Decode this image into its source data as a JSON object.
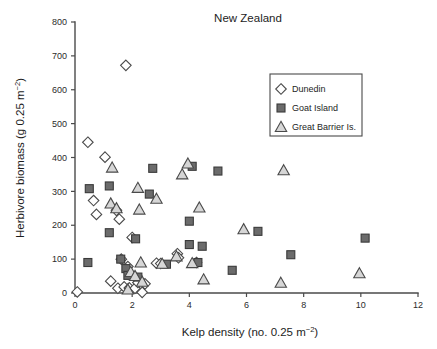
{
  "figure": {
    "title": "New Zealand",
    "background_color": "#ffffff"
  },
  "axes": {
    "x": {
      "label_main": "Kelp density (no. 0.25 m",
      "label_sup": "−2",
      "label_tail": ")",
      "ticks": [
        "0",
        "2",
        "4",
        "6",
        "8",
        "10",
        "12"
      ],
      "min": 0,
      "max": 12
    },
    "y": {
      "label_main": "Herbivore biomass (g 0.25 m",
      "label_sup": "−2",
      "label_tail": ")",
      "ticks": [
        "0",
        "100",
        "200",
        "300",
        "400",
        "500",
        "600",
        "700",
        "800"
      ],
      "min": 0,
      "max": 800
    }
  },
  "legend": {
    "position": "top-right",
    "entries": [
      {
        "label": "Dunedin",
        "marker": "diamond",
        "fill": "#ffffff",
        "stroke": "#4a4a4a"
      },
      {
        "label": "Goat Island",
        "marker": "square",
        "fill": "#6b6b6b",
        "stroke": "#3a3a3a"
      },
      {
        "label": "Great Barrier Is.",
        "marker": "triangle",
        "fill": "#d6d6d6",
        "stroke": "#4a4a4a"
      }
    ]
  },
  "chart_data": {
    "type": "scatter",
    "title": "New Zealand",
    "xlabel": "Kelp density (no. 0.25 m−2)",
    "ylabel": "Herbivore biomass (g 0.25 m−2)",
    "xlim": [
      0,
      12
    ],
    "ylim": [
      0,
      800
    ],
    "xticks": [
      0,
      2,
      4,
      6,
      8,
      10,
      12
    ],
    "yticks": [
      0,
      100,
      200,
      300,
      400,
      500,
      600,
      700,
      800
    ],
    "grid": false,
    "legend_position": "upper right",
    "series": [
      {
        "name": "Dunedin",
        "marker": "diamond",
        "fill": "#ffffff",
        "stroke": "#4a4a4a",
        "points": [
          [
            0.08,
            3
          ],
          [
            0.45,
            445
          ],
          [
            0.65,
            273
          ],
          [
            0.75,
            232
          ],
          [
            1.05,
            401
          ],
          [
            1.25,
            35
          ],
          [
            1.45,
            244
          ],
          [
            1.5,
            14
          ],
          [
            1.55,
            218
          ],
          [
            1.62,
            100
          ],
          [
            1.72,
            18
          ],
          [
            1.78,
            672
          ],
          [
            1.85,
            78
          ],
          [
            1.9,
            15
          ],
          [
            2.0,
            164
          ],
          [
            2.1,
            14
          ],
          [
            2.2,
            31
          ],
          [
            2.35,
            2
          ],
          [
            2.45,
            27
          ],
          [
            2.85,
            88
          ],
          [
            3.0,
            87
          ],
          [
            3.58,
            116
          ],
          [
            3.62,
            104
          ],
          [
            4.25,
            90
          ]
        ]
      },
      {
        "name": "Goat Island",
        "marker": "square",
        "fill": "#6b6b6b",
        "stroke": "#3a3a3a",
        "points": [
          [
            0.45,
            90
          ],
          [
            0.5,
            308
          ],
          [
            1.2,
            316
          ],
          [
            1.2,
            178
          ],
          [
            1.6,
            100
          ],
          [
            1.78,
            72
          ],
          [
            1.85,
            52
          ],
          [
            2.12,
            160
          ],
          [
            2.2,
            47
          ],
          [
            2.6,
            292
          ],
          [
            2.72,
            368
          ],
          [
            3.2,
            85
          ],
          [
            4.0,
            212
          ],
          [
            4.0,
            143
          ],
          [
            4.1,
            374
          ],
          [
            4.3,
            90
          ],
          [
            4.45,
            138
          ],
          [
            5.0,
            360
          ],
          [
            5.5,
            67
          ],
          [
            6.4,
            182
          ],
          [
            7.55,
            113
          ],
          [
            10.15,
            162
          ]
        ]
      },
      {
        "name": "Great Barrier Is.",
        "marker": "triangle",
        "fill": "#d6d6d6",
        "stroke": "#4a4a4a",
        "points": [
          [
            1.25,
            264
          ],
          [
            1.3,
            370
          ],
          [
            1.45,
            250
          ],
          [
            1.85,
            10
          ],
          [
            1.95,
            62
          ],
          [
            2.1,
            50
          ],
          [
            2.2,
            310
          ],
          [
            2.25,
            246
          ],
          [
            2.3,
            90
          ],
          [
            2.35,
            33
          ],
          [
            2.85,
            278
          ],
          [
            3.05,
            86
          ],
          [
            3.55,
            108
          ],
          [
            3.75,
            350
          ],
          [
            3.95,
            382
          ],
          [
            4.1,
            88
          ],
          [
            4.35,
            252
          ],
          [
            4.5,
            40
          ],
          [
            5.9,
            188
          ],
          [
            7.2,
            30
          ],
          [
            7.3,
            362
          ],
          [
            9.95,
            58
          ]
        ]
      }
    ]
  },
  "plot_geometry": {
    "origin_x_px": 75,
    "origin_y_px": 293,
    "x_axis_end_px": 418,
    "y_axis_top_px": 22
  }
}
